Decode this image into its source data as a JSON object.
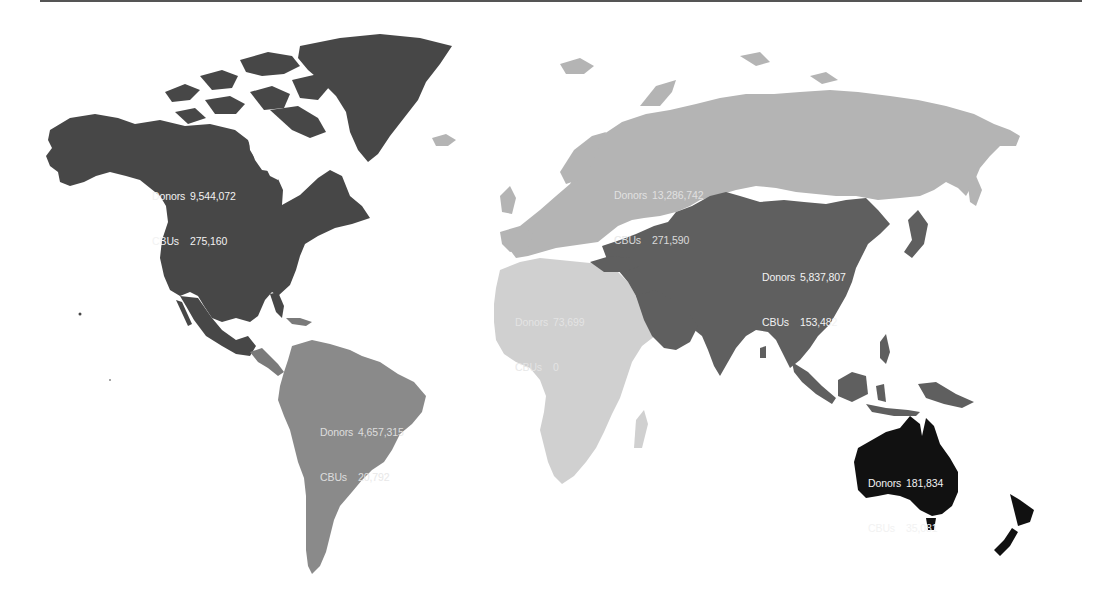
{
  "figure": {
    "type": "choropleth-world-map",
    "legend": "none",
    "colors": {
      "north_america": "#474747",
      "europe_russia": "#b4b4b4",
      "asia": "#5f5f5f",
      "africa": "#d0d0d0",
      "south_america": "#8a8a8a",
      "central_america": "#7a7a7a",
      "oceania": "#111111",
      "background": "#ffffff",
      "top_rule": "#555555"
    }
  },
  "regions": [
    {
      "id": "north_america",
      "donors_label": "Donors",
      "donors": "9,544,072",
      "cbus_label": "CBUs",
      "cbus": "275,160"
    },
    {
      "id": "europe",
      "donors_label": "Donors",
      "donors": "13,286,742",
      "cbus_label": "CBUs",
      "cbus": "271,590"
    },
    {
      "id": "asia",
      "donors_label": "Donors",
      "donors": "5,837,807",
      "cbus_label": "CBUs",
      "cbus": "153,482"
    },
    {
      "id": "africa",
      "donors_label": "Donors",
      "donors": "73,699",
      "cbus_label": "CBUs",
      "cbus": "0"
    },
    {
      "id": "south_america",
      "donors_label": "Donors",
      "donors": "4,657,315",
      "cbus_label": "CBUs",
      "cbus": "20,792"
    },
    {
      "id": "oceania",
      "donors_label": "Donors",
      "donors": "181,834",
      "cbus_label": "CBUs",
      "cbus": "35,081"
    }
  ]
}
